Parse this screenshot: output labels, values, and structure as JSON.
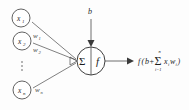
{
  "diagram": {
    "type": "neural-network-neuron",
    "inputs": [
      {
        "id": "x1",
        "base": "x",
        "sub": "1"
      },
      {
        "id": "x2",
        "base": "x",
        "sub": "2"
      },
      {
        "id": "xn",
        "base": "x",
        "sub": "n"
      }
    ],
    "ellipsis": "⋮",
    "weights": [
      {
        "id": "w1",
        "base": "w",
        "sub": "1"
      },
      {
        "id": "w2",
        "base": "w",
        "sub": "2"
      },
      {
        "id": "wn",
        "base": "w",
        "sub": "n"
      }
    ],
    "bias": {
      "label": "b"
    },
    "body": {
      "sum_glyph": "Σ",
      "activation_glyph": "f"
    },
    "output": {
      "f": "f",
      "open_paren": "(",
      "bias_term": "b",
      "plus": "+",
      "sigma": "Σ",
      "upper_limit": "n",
      "lower_limit": "i=1",
      "term_x": "x",
      "term_x_sub": "i",
      "term_w": "w",
      "term_w_sub": "i",
      "close_paren": ")",
      "full_text": "f(b+Σ xᵢwᵢ)"
    },
    "colors": {
      "background": "#fdfdfd",
      "stroke": "#3a3a3a",
      "text": "#1c1c1c"
    }
  }
}
